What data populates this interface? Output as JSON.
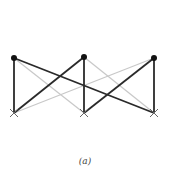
{
  "caption": "(a)",
  "colors": {
    "dark_edge": "#2a2a2a",
    "light_edge": "#c8c8c8",
    "node": "#111111",
    "cross": "#666666"
  },
  "top_nodes": [
    {
      "id": "T0",
      "x": 14,
      "y": 58
    },
    {
      "id": "T1",
      "x": 84,
      "y": 57
    },
    {
      "id": "T2",
      "x": 154,
      "y": 58
    }
  ],
  "bottom_nodes": [
    {
      "id": "B0",
      "x": 14,
      "y": 113
    },
    {
      "id": "B1",
      "x": 84,
      "y": 113
    },
    {
      "id": "B2",
      "x": 154,
      "y": 113
    }
  ],
  "edges": [
    {
      "from": "T0",
      "to": "B0",
      "style": "dark"
    },
    {
      "from": "T1",
      "to": "B1",
      "style": "dark"
    },
    {
      "from": "T2",
      "to": "B2",
      "style": "dark"
    },
    {
      "from": "T0",
      "to": "B2",
      "style": "dark"
    },
    {
      "from": "T1",
      "to": "B0",
      "style": "dark"
    },
    {
      "from": "T2",
      "to": "B1",
      "style": "dark"
    },
    {
      "from": "T0",
      "to": "B1",
      "style": "light"
    },
    {
      "from": "T1",
      "to": "B2",
      "style": "light"
    },
    {
      "from": "T2",
      "to": "B0",
      "style": "light"
    }
  ]
}
